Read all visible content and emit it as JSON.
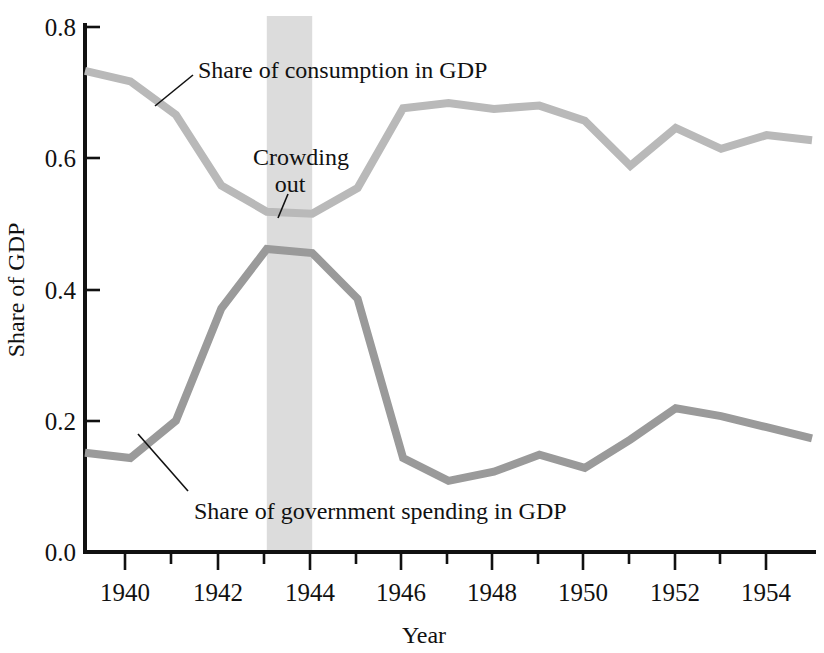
{
  "chart_data": {
    "type": "line",
    "title": "",
    "xlabel": "Year",
    "ylabel": "Share of GDP",
    "xlim": [
      1939,
      1955
    ],
    "ylim": [
      0.0,
      0.8
    ],
    "grid": false,
    "legend_position": "inline-annotations",
    "x": [
      1939,
      1940,
      1941,
      1942,
      1943,
      1944,
      1945,
      1946,
      1947,
      1948,
      1949,
      1950,
      1951,
      1952,
      1953,
      1954,
      1955
    ],
    "x_tick_labels": [
      "1940",
      "1942",
      "1944",
      "1946",
      "1948",
      "1950",
      "1952",
      "1954"
    ],
    "x_tick_values": [
      1940,
      1942,
      1944,
      1946,
      1948,
      1950,
      1952,
      1954
    ],
    "x_minor_ticks": [
      1940,
      1941,
      1942,
      1943,
      1944,
      1945,
      1946,
      1947,
      1948,
      1949,
      1950,
      1951,
      1952,
      1953,
      1954
    ],
    "y_tick_labels": [
      "0.0",
      "0.2",
      "0.4",
      "0.6",
      "0.8"
    ],
    "y_tick_values": [
      0.0,
      0.2,
      0.4,
      0.6,
      0.8
    ],
    "series": [
      {
        "name": "Share of consumption in GDP",
        "color": "#b9b9b9",
        "values": [
          0.733,
          0.717,
          0.666,
          0.558,
          0.518,
          0.515,
          0.554,
          0.676,
          0.684,
          0.675,
          0.68,
          0.657,
          0.588,
          0.646,
          0.614,
          0.635,
          0.627
        ]
      },
      {
        "name": "Share of government spending in GDP",
        "color": "#9a9a9a",
        "values": [
          0.15,
          0.142,
          0.199,
          0.37,
          0.461,
          0.455,
          0.385,
          0.142,
          0.107,
          0.121,
          0.147,
          0.127,
          0.17,
          0.218,
          0.206,
          0.189,
          0.172
        ]
      }
    ],
    "annotations": [
      {
        "name": "consumption-label",
        "text": "Share of consumption in GDP",
        "points_to_x": 1941,
        "points_to_y": 0.666
      },
      {
        "name": "crowding-out-label",
        "text_line1": "Crowding",
        "text_line2": "out",
        "points_to_x": 1943.4,
        "points_to_y": 0.515
      },
      {
        "name": "government-label",
        "text": "Share of government spending in GDP",
        "points_to_x": 1940.6,
        "points_to_y": 0.168
      }
    ],
    "shaded_band": {
      "name": "crowding-out-band",
      "x_start": 1943,
      "x_end": 1944,
      "color": "#dcdcdc",
      "label": "Crowding out"
    }
  }
}
